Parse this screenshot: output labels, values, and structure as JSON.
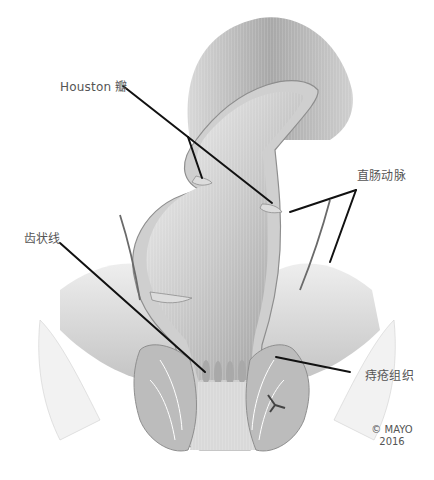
{
  "figure": {
    "colors": {
      "background": "#ffffff",
      "leader_line": "#111111",
      "label_text": "#555555",
      "tissue_dark": "#8a8a8a",
      "tissue_mid": "#b8b8b8",
      "tissue_light": "#e4e4e4"
    }
  },
  "labels": {
    "houston_valve": "Houston 瓣",
    "rectal_artery": "直肠动脉",
    "dentate_line": "齿状线",
    "hemorrhoidal_tissue": "痔疮组织"
  },
  "copyright": {
    "line1": "© MAYO",
    "line2": "2016"
  }
}
